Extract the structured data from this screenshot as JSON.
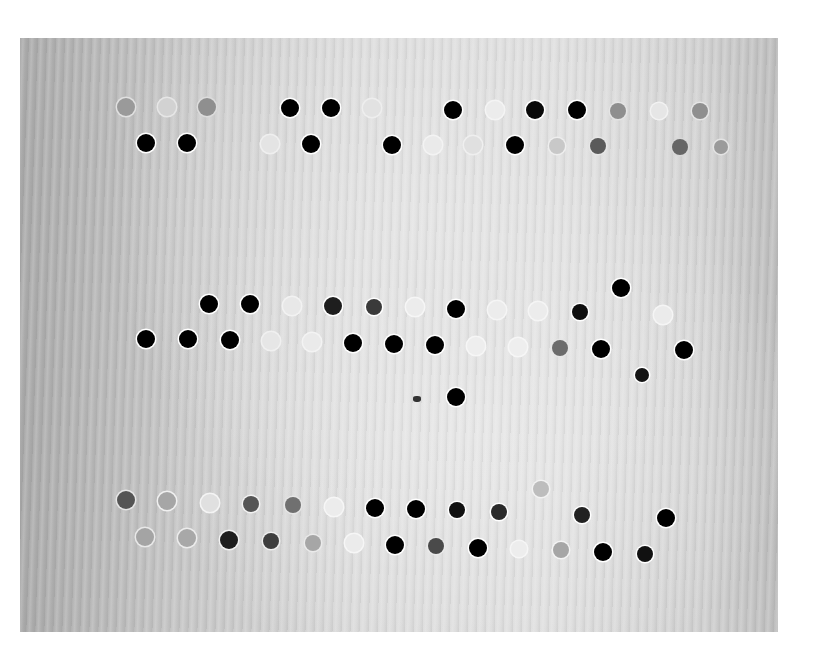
{
  "image": {
    "description": "Grayscale photograph of a textured surface with three bands of punched holes (two staggered rows per band); some holes appear dark, others faint/light",
    "background_color": "#ffffff",
    "surface_tone": "#cfcfcf"
  },
  "holes": [
    {
      "x": 126,
      "y": 107,
      "tone": "#9a9a9a",
      "ring": "#e0e0e0",
      "r": 9
    },
    {
      "x": 167,
      "y": 107,
      "tone": "#d2d2d2",
      "ring": "#e6e6e6",
      "r": 9
    },
    {
      "x": 207,
      "y": 107,
      "tone": "#8f8f8f",
      "ring": "#dcdcdc",
      "r": 9
    },
    {
      "x": 290,
      "y": 108,
      "tone": "#000000",
      "ring": "#ffffff",
      "r": 9
    },
    {
      "x": 331,
      "y": 108,
      "tone": "#000000",
      "ring": "#ffffff",
      "r": 9
    },
    {
      "x": 372,
      "y": 108,
      "tone": "#e2e2e2",
      "ring": "#eeeeee",
      "r": 9
    },
    {
      "x": 453,
      "y": 110,
      "tone": "#000000",
      "ring": "#ffffff",
      "r": 9
    },
    {
      "x": 495,
      "y": 110,
      "tone": "#ececec",
      "ring": "#f4f4f4",
      "r": 9
    },
    {
      "x": 535,
      "y": 110,
      "tone": "#0a0a0a",
      "ring": "#ffffff",
      "r": 9
    },
    {
      "x": 577,
      "y": 110,
      "tone": "#000000",
      "ring": "#ffffff",
      "r": 9
    },
    {
      "x": 618,
      "y": 111,
      "tone": "#8e8e8e",
      "ring": "#e4e4e4",
      "r": 8
    },
    {
      "x": 659,
      "y": 111,
      "tone": "#e6e6e6",
      "ring": "#f2f2f2",
      "r": 8
    },
    {
      "x": 700,
      "y": 111,
      "tone": "#8f8f8f",
      "ring": "#e6e6e6",
      "r": 8
    },
    {
      "x": 146,
      "y": 143,
      "tone": "#000000",
      "ring": "#ffffff",
      "r": 9
    },
    {
      "x": 187,
      "y": 143,
      "tone": "#000000",
      "ring": "#ffffff",
      "r": 9
    },
    {
      "x": 270,
      "y": 144,
      "tone": "#e4e4e4",
      "ring": "#efefef",
      "r": 9
    },
    {
      "x": 311,
      "y": 144,
      "tone": "#000000",
      "ring": "#ffffff",
      "r": 9
    },
    {
      "x": 392,
      "y": 145,
      "tone": "#000000",
      "ring": "#ffffff",
      "r": 9
    },
    {
      "x": 433,
      "y": 145,
      "tone": "#eaeaea",
      "ring": "#f3f3f3",
      "r": 9
    },
    {
      "x": 473,
      "y": 145,
      "tone": "#e0e0e0",
      "ring": "#efefef",
      "r": 9
    },
    {
      "x": 515,
      "y": 145,
      "tone": "#000000",
      "ring": "#ffffff",
      "r": 9
    },
    {
      "x": 557,
      "y": 146,
      "tone": "#c8c8c8",
      "ring": "#eeeeee",
      "r": 8
    },
    {
      "x": 598,
      "y": 146,
      "tone": "#5a5a5a",
      "ring": "#e6e6e6",
      "r": 8
    },
    {
      "x": 680,
      "y": 147,
      "tone": "#666666",
      "ring": "#d8d8d8",
      "r": 8
    },
    {
      "x": 721,
      "y": 147,
      "tone": "#9a9a9a",
      "ring": "#e4e4e4",
      "r": 7
    },
    {
      "x": 209,
      "y": 304,
      "tone": "#000000",
      "ring": "#ffffff",
      "r": 9
    },
    {
      "x": 250,
      "y": 304,
      "tone": "#000000",
      "ring": "#ffffff",
      "r": 9
    },
    {
      "x": 292,
      "y": 306,
      "tone": "#e8e8e8",
      "ring": "#f2f2f2",
      "r": 9
    },
    {
      "x": 333,
      "y": 306,
      "tone": "#1e1e1e",
      "ring": "#ffffff",
      "r": 9
    },
    {
      "x": 374,
      "y": 307,
      "tone": "#3a3a3a",
      "ring": "#ffffff",
      "r": 8
    },
    {
      "x": 415,
      "y": 307,
      "tone": "#ececec",
      "ring": "#f6f6f6",
      "r": 9
    },
    {
      "x": 456,
      "y": 309,
      "tone": "#000000",
      "ring": "#ffffff",
      "r": 9
    },
    {
      "x": 497,
      "y": 310,
      "tone": "#ececec",
      "ring": "#f5f5f5",
      "r": 9
    },
    {
      "x": 538,
      "y": 311,
      "tone": "#ececec",
      "ring": "#f5f5f5",
      "r": 9
    },
    {
      "x": 580,
      "y": 312,
      "tone": "#0e0e0e",
      "ring": "#ffffff",
      "r": 8
    },
    {
      "x": 621,
      "y": 288,
      "tone": "#000000",
      "ring": "#ffffff",
      "r": 9
    },
    {
      "x": 663,
      "y": 315,
      "tone": "#ebebeb",
      "ring": "#f5f5f5",
      "r": 9
    },
    {
      "x": 146,
      "y": 339,
      "tone": "#000000",
      "ring": "#ffffff",
      "r": 9
    },
    {
      "x": 188,
      "y": 339,
      "tone": "#000000",
      "ring": "#ffffff",
      "r": 9
    },
    {
      "x": 230,
      "y": 340,
      "tone": "#000000",
      "ring": "#ffffff",
      "r": 9
    },
    {
      "x": 271,
      "y": 341,
      "tone": "#e6e6e6",
      "ring": "#f0f0f0",
      "r": 9
    },
    {
      "x": 312,
      "y": 342,
      "tone": "#eaeaea",
      "ring": "#f3f3f3",
      "r": 9
    },
    {
      "x": 353,
      "y": 343,
      "tone": "#000000",
      "ring": "#ffffff",
      "r": 9
    },
    {
      "x": 394,
      "y": 344,
      "tone": "#000000",
      "ring": "#ffffff",
      "r": 9
    },
    {
      "x": 435,
      "y": 345,
      "tone": "#000000",
      "ring": "#ffffff",
      "r": 9
    },
    {
      "x": 476,
      "y": 346,
      "tone": "#eeeeee",
      "ring": "#f6f6f6",
      "r": 9
    },
    {
      "x": 518,
      "y": 347,
      "tone": "#eeeeee",
      "ring": "#f6f6f6",
      "r": 9
    },
    {
      "x": 560,
      "y": 348,
      "tone": "#6c6c6c",
      "ring": "#e6e6e6",
      "r": 8
    },
    {
      "x": 601,
      "y": 349,
      "tone": "#000000",
      "ring": "#ffffff",
      "r": 9
    },
    {
      "x": 642,
      "y": 375,
      "tone": "#141414",
      "ring": "#ffffff",
      "r": 7
    },
    {
      "x": 684,
      "y": 350,
      "tone": "#000000",
      "ring": "#ffffff",
      "r": 9
    },
    {
      "x": 456,
      "y": 397,
      "tone": "#000000",
      "ring": "#ffffff",
      "r": 9
    },
    {
      "x": 126,
      "y": 500,
      "tone": "#555555",
      "ring": "#e6e6e6",
      "r": 9
    },
    {
      "x": 167,
      "y": 501,
      "tone": "#a6a6a6",
      "ring": "#f0f0f0",
      "r": 9
    },
    {
      "x": 210,
      "y": 503,
      "tone": "#e0e0e0",
      "ring": "#f4f4f4",
      "r": 9
    },
    {
      "x": 251,
      "y": 504,
      "tone": "#555555",
      "ring": "#f2f2f2",
      "r": 8
    },
    {
      "x": 293,
      "y": 505,
      "tone": "#707070",
      "ring": "#e6e6e6",
      "r": 8
    },
    {
      "x": 334,
      "y": 507,
      "tone": "#ececec",
      "ring": "#f6f6f6",
      "r": 9
    },
    {
      "x": 375,
      "y": 508,
      "tone": "#000000",
      "ring": "#ffffff",
      "r": 9
    },
    {
      "x": 416,
      "y": 509,
      "tone": "#000000",
      "ring": "#ffffff",
      "r": 9
    },
    {
      "x": 457,
      "y": 510,
      "tone": "#111111",
      "ring": "#ffffff",
      "r": 8
    },
    {
      "x": 499,
      "y": 512,
      "tone": "#2a2a2a",
      "ring": "#ffffff",
      "r": 8
    },
    {
      "x": 541,
      "y": 489,
      "tone": "#bdbdbd",
      "ring": "#f2f2f2",
      "r": 8
    },
    {
      "x": 582,
      "y": 515,
      "tone": "#222222",
      "ring": "#ffffff",
      "r": 8
    },
    {
      "x": 666,
      "y": 518,
      "tone": "#000000",
      "ring": "#ffffff",
      "r": 9
    },
    {
      "x": 145,
      "y": 537,
      "tone": "#a4a4a4",
      "ring": "#e8e8e8",
      "r": 9
    },
    {
      "x": 187,
      "y": 538,
      "tone": "#a8a8a8",
      "ring": "#ececec",
      "r": 9
    },
    {
      "x": 229,
      "y": 540,
      "tone": "#1e1e1e",
      "ring": "#f2f2f2",
      "r": 9
    },
    {
      "x": 271,
      "y": 541,
      "tone": "#3e3e3e",
      "ring": "#f0f0f0",
      "r": 8
    },
    {
      "x": 313,
      "y": 543,
      "tone": "#a6a6a6",
      "ring": "#eaeaea",
      "r": 8
    },
    {
      "x": 354,
      "y": 543,
      "tone": "#ebebeb",
      "ring": "#f6f6f6",
      "r": 9
    },
    {
      "x": 395,
      "y": 545,
      "tone": "#000000",
      "ring": "#ffffff",
      "r": 9
    },
    {
      "x": 436,
      "y": 546,
      "tone": "#4a4a4a",
      "ring": "#eaeaea",
      "r": 8
    },
    {
      "x": 478,
      "y": 548,
      "tone": "#000000",
      "ring": "#ffffff",
      "r": 9
    },
    {
      "x": 519,
      "y": 549,
      "tone": "#ededed",
      "ring": "#f6f6f6",
      "r": 8
    },
    {
      "x": 561,
      "y": 550,
      "tone": "#a6a6a6",
      "ring": "#f4f4f4",
      "r": 8
    },
    {
      "x": 603,
      "y": 552,
      "tone": "#000000",
      "ring": "#ffffff",
      "r": 9
    },
    {
      "x": 645,
      "y": 554,
      "tone": "#111111",
      "ring": "#ffffff",
      "r": 8
    }
  ]
}
